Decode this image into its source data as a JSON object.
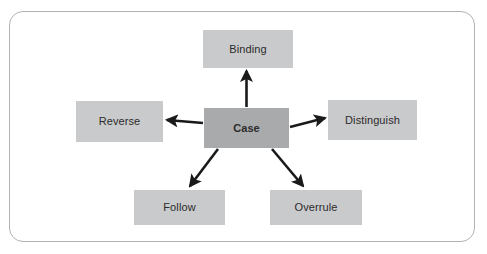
{
  "diagram": {
    "type": "hub-and-spoke",
    "frame": {
      "border_color": "#b0b2b4",
      "background": "#ffffff",
      "corner_radius": "14px"
    },
    "colors": {
      "center_node_fill": "#a9aaac",
      "outer_node_fill": "#c9cacb",
      "arrow_color": "#1a1a1a",
      "text_color": "#2b2b2b"
    },
    "center": {
      "label": "Case"
    },
    "nodes": [
      {
        "id": "binding",
        "label": "Binding"
      },
      {
        "id": "reverse",
        "label": "Reverse"
      },
      {
        "id": "distinguish",
        "label": "Distinguish"
      },
      {
        "id": "follow",
        "label": "Follow"
      },
      {
        "id": "overrule",
        "label": "Overrule"
      }
    ],
    "connections": [
      {
        "from": "Case",
        "to": "Binding",
        "direction": "up"
      },
      {
        "from": "Case",
        "to": "Reverse",
        "direction": "left"
      },
      {
        "from": "Case",
        "to": "Distinguish",
        "direction": "right"
      },
      {
        "from": "Case",
        "to": "Follow",
        "direction": "down-left"
      },
      {
        "from": "Case",
        "to": "Overrule",
        "direction": "down-right"
      }
    ]
  }
}
